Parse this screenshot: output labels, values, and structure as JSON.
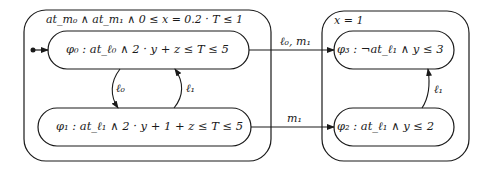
{
  "diagram": {
    "left_superstate": {
      "label": "at_m₀ ∧ at_m₁ ∧ 0 ≤ x = 0.2 · T ≤ 1"
    },
    "right_superstate": {
      "label": "x = 1"
    },
    "states": [
      {
        "id": "phi0",
        "label": "φ₀ :  at_ℓ₀ ∧ 2 · y + z ≤ T ≤ 5",
        "initial": true
      },
      {
        "id": "phi1",
        "label": "φ₁ :  at_ℓ₁ ∧ 2 · y + 1 + z ≤ T ≤ 5"
      },
      {
        "id": "phi3",
        "label": "φ₃ :  ¬at_ℓ₁ ∧ y ≤ 3"
      },
      {
        "id": "phi2",
        "label": "φ₂ :  at_ℓ₁ ∧ y ≤ 2"
      }
    ],
    "transitions": [
      {
        "from": "phi0",
        "to": "phi1",
        "label": "ℓ₀"
      },
      {
        "from": "phi1",
        "to": "phi0",
        "label": "ℓ₁"
      },
      {
        "from": "phi0",
        "to": "phi3",
        "label": "ℓ₀, m₁"
      },
      {
        "from": "phi1",
        "to": "phi2",
        "label": "m₁"
      },
      {
        "from": "phi2",
        "to": "phi3",
        "label": "ℓ₁"
      }
    ]
  }
}
